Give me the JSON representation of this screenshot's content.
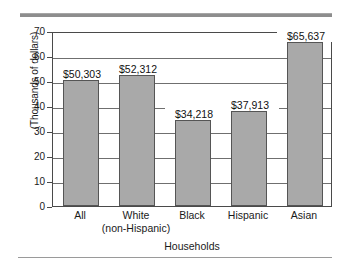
{
  "chart_data": {
    "type": "bar",
    "title": "",
    "xlabel": "Households",
    "ylabel": "(Thousands of dollars)",
    "categories": [
      "All",
      "White (non-Hispanic)",
      "Black",
      "Hispanic",
      "Asian"
    ],
    "category_lines": [
      {
        "line1": "All",
        "line2": ""
      },
      {
        "line1": "White",
        "line2": "(non-Hispanic)"
      },
      {
        "line1": "Black",
        "line2": ""
      },
      {
        "line1": "Hispanic",
        "line2": ""
      },
      {
        "line1": "Asian",
        "line2": ""
      }
    ],
    "values": [
      50.303,
      52.312,
      34.218,
      37.913,
      65.637
    ],
    "data_labels": [
      "$50,303",
      "$52,312",
      "$34,218",
      "$37,913",
      "$65,637"
    ],
    "ylim": [
      0,
      70
    ],
    "yticks": [
      0,
      10,
      20,
      30,
      40,
      50,
      60,
      70
    ],
    "ytick_labels": [
      "0",
      "10",
      "20",
      "30",
      "40",
      "50",
      "60",
      "70"
    ],
    "grid": true,
    "legend": "none",
    "bar_color": "#a9a9a9",
    "bar_edge_color": "#555555",
    "axis_color": "#4a4a4a",
    "grid_color": "#6f6f6f",
    "background": "#ffffff"
  }
}
